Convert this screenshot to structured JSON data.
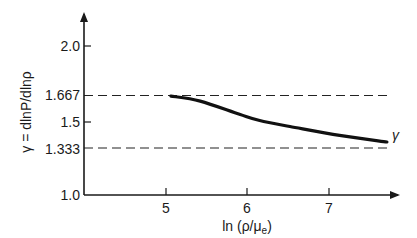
{
  "chart_data": {
    "type": "line",
    "title": "",
    "xlabel": "ln (ρ/μe)",
    "xlabel_parts": {
      "prefix": "ln (ρ/μ",
      "subscript": "e",
      "suffix": ")"
    },
    "ylabel": "γ = dlnP/dlnρ",
    "xlim": [
      3.94,
      7.85
    ],
    "ylim": [
      1.0,
      2.3
    ],
    "x_ticks": [
      5,
      6,
      7
    ],
    "x_tick_labels": [
      "5",
      "6",
      "7"
    ],
    "y_ticks": [
      1.0,
      1.333,
      1.5,
      1.667,
      2.0
    ],
    "y_tick_labels": [
      "1.0",
      "1.333",
      "1.5",
      "1.667",
      "2.0"
    ],
    "grid": false,
    "legend": null,
    "series": [
      {
        "name": "γ",
        "style": "solid",
        "x": [
          5.06,
          5.42,
          5.91,
          6.15,
          6.52,
          7.13,
          7.71
        ],
        "y": [
          1.664,
          1.63,
          1.54,
          1.5,
          1.46,
          1.4,
          1.356
        ]
      }
    ],
    "reference_lines": [
      {
        "y": 1.667,
        "style": "dashed",
        "label": "1.667"
      },
      {
        "y": 1.333,
        "style": "dashed",
        "label": "1.333"
      }
    ],
    "annotations": [
      {
        "text": "γ",
        "x": 7.77,
        "y": 1.41
      }
    ]
  }
}
